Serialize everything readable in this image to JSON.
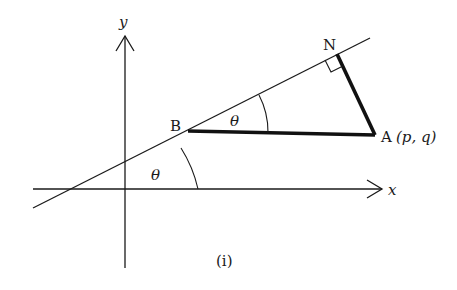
{
  "figure": {
    "caption": "(i)",
    "axes": {
      "x_label": "x",
      "y_label": "y"
    },
    "points": {
      "B": {
        "label": "B"
      },
      "N": {
        "label": "N"
      },
      "A": {
        "label": "A",
        "coords": "(p, q)"
      }
    },
    "angles": {
      "at_axis": "θ",
      "at_B": "θ"
    },
    "colors": {
      "line": "#1a1a1a",
      "background": "#ffffff"
    }
  }
}
